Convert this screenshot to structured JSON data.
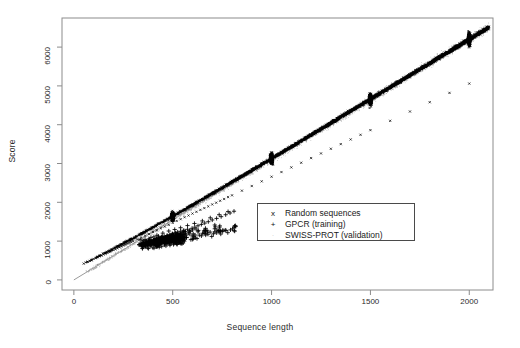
{
  "chart_data": {
    "type": "scatter",
    "title": "",
    "xlabel": "Sequence length",
    "ylabel": "Score",
    "xlim": [
      -60,
      2120
    ],
    "ylim": [
      -260,
      6750
    ],
    "xticks": [
      0,
      500,
      1000,
      1500,
      2000
    ],
    "yticks": [
      0,
      1000,
      2000,
      3000,
      4000,
      5000,
      6000
    ],
    "grid": false,
    "legend_position": "center-right",
    "frame": true,
    "trend_line": {
      "name": "linear fit",
      "slope": 3.1,
      "intercept": 0,
      "x_start": 0,
      "x_end": 2100,
      "color": "#808080"
    },
    "series": [
      {
        "name": "Random sequences",
        "marker": "x",
        "color": "#000000",
        "description": "dense band following score = 3.1 x length, sampled densely at lengths 50-2000 with heavy vertical clusters at 500, 1000, 1500 and 2000",
        "cluster_lengths": [
          500,
          1000,
          1500,
          2000
        ],
        "points": [
          [
            50,
            420
          ],
          [
            60,
            450
          ],
          [
            70,
            470
          ],
          [
            80,
            490
          ],
          [
            90,
            510
          ],
          [
            100,
            540
          ],
          [
            110,
            560
          ],
          [
            120,
            585
          ],
          [
            130,
            610
          ],
          [
            140,
            630
          ],
          [
            150,
            655
          ],
          [
            160,
            675
          ],
          [
            170,
            700
          ],
          [
            180,
            720
          ],
          [
            190,
            745
          ],
          [
            200,
            770
          ],
          [
            210,
            790
          ],
          [
            220,
            815
          ],
          [
            230,
            840
          ],
          [
            240,
            860
          ],
          [
            250,
            885
          ],
          [
            260,
            905
          ],
          [
            270,
            930
          ],
          [
            280,
            955
          ],
          [
            290,
            975
          ],
          [
            300,
            1000
          ],
          [
            320,
            1045
          ],
          [
            340,
            1090
          ],
          [
            360,
            1140
          ],
          [
            380,
            1185
          ],
          [
            400,
            1235
          ],
          [
            420,
            1280
          ],
          [
            440,
            1330
          ],
          [
            460,
            1375
          ],
          [
            480,
            1420
          ],
          [
            500,
            1470
          ],
          [
            520,
            1520
          ],
          [
            540,
            1565
          ],
          [
            560,
            1615
          ],
          [
            580,
            1660
          ],
          [
            600,
            1710
          ],
          [
            620,
            1755
          ],
          [
            640,
            1805
          ],
          [
            660,
            1850
          ],
          [
            680,
            1895
          ],
          [
            700,
            1945
          ],
          [
            720,
            1990
          ],
          [
            740,
            2040
          ],
          [
            760,
            2085
          ],
          [
            780,
            2135
          ],
          [
            800,
            2180
          ],
          [
            850,
            2300
          ],
          [
            900,
            2420
          ],
          [
            950,
            2540
          ],
          [
            1000,
            2660
          ],
          [
            1050,
            2780
          ],
          [
            1100,
            2900
          ],
          [
            1150,
            3020
          ],
          [
            1200,
            3140
          ],
          [
            1250,
            3260
          ],
          [
            1300,
            3380
          ],
          [
            1350,
            3500
          ],
          [
            1400,
            3620
          ],
          [
            1450,
            3740
          ],
          [
            1500,
            3860
          ],
          [
            1600,
            4100
          ],
          [
            1700,
            4340
          ],
          [
            1800,
            4580
          ],
          [
            1900,
            4820
          ],
          [
            2000,
            5060
          ]
        ]
      },
      {
        "name": "GPCR (training)",
        "marker": "+",
        "color": "#000000",
        "description": "cluster of training sequences below the random-sequence band, lengths 320-810, scores 850-1950",
        "points": [
          [
            330,
            905
          ],
          [
            338,
            930
          ],
          [
            345,
            880
          ],
          [
            352,
            950
          ],
          [
            358,
            910
          ],
          [
            365,
            965
          ],
          [
            372,
            935
          ],
          [
            378,
            990
          ],
          [
            385,
            955
          ],
          [
            392,
            1010
          ],
          [
            398,
            975
          ],
          [
            405,
            1030
          ],
          [
            412,
            1000
          ],
          [
            418,
            1055
          ],
          [
            425,
            1020
          ],
          [
            432,
            1080
          ],
          [
            438,
            1045
          ],
          [
            445,
            1100
          ],
          [
            452,
            1065
          ],
          [
            458,
            1120
          ],
          [
            465,
            1090
          ],
          [
            472,
            1145
          ],
          [
            478,
            1110
          ],
          [
            485,
            1165
          ],
          [
            492,
            1135
          ],
          [
            498,
            1190
          ],
          [
            505,
            1155
          ],
          [
            512,
            1210
          ],
          [
            518,
            1180
          ],
          [
            525,
            1235
          ],
          [
            532,
            1200
          ],
          [
            540,
            1255
          ],
          [
            548,
            1225
          ],
          [
            556,
            1280
          ],
          [
            565,
            1250
          ],
          [
            575,
            1305
          ],
          [
            585,
            1275
          ],
          [
            598,
            1330
          ],
          [
            612,
            1360
          ],
          [
            628,
            1395
          ],
          [
            645,
            1430
          ],
          [
            662,
            1465
          ],
          [
            680,
            1500
          ],
          [
            700,
            1545
          ],
          [
            722,
            1585
          ],
          [
            745,
            1630
          ],
          [
            768,
            1680
          ],
          [
            790,
            1725
          ],
          [
            810,
            1770
          ],
          [
            360,
            1040
          ],
          [
            390,
            1095
          ],
          [
            420,
            1150
          ],
          [
            450,
            1205
          ],
          [
            480,
            1260
          ],
          [
            510,
            1300
          ],
          [
            540,
            1345
          ],
          [
            575,
            1400
          ],
          [
            610,
            1455
          ],
          [
            650,
            1520
          ],
          [
            690,
            1600
          ],
          [
            735,
            1680
          ],
          [
            780,
            1760
          ]
        ]
      },
      {
        "name": "SWISS-PROT (validation)",
        "marker": ".",
        "color": "#a0a0a0",
        "description": "faint light-grey point cloud scattered tightly along the regression line across the full length range",
        "points": [
          [
            120,
            400
          ],
          [
            180,
            570
          ],
          [
            240,
            740
          ],
          [
            300,
            930
          ],
          [
            360,
            1120
          ],
          [
            420,
            1300
          ],
          [
            480,
            1490
          ],
          [
            540,
            1680
          ],
          [
            600,
            1860
          ],
          [
            660,
            2050
          ],
          [
            720,
            2240
          ],
          [
            780,
            2420
          ],
          [
            840,
            2610
          ],
          [
            900,
            2790
          ],
          [
            960,
            2980
          ],
          [
            1020,
            3170
          ],
          [
            1080,
            3350
          ],
          [
            1140,
            3540
          ],
          [
            1200,
            3720
          ],
          [
            1260,
            3910
          ],
          [
            1320,
            4100
          ],
          [
            1380,
            4280
          ],
          [
            1440,
            4470
          ],
          [
            1500,
            4650
          ],
          [
            1560,
            4840
          ],
          [
            1620,
            5030
          ],
          [
            1680,
            5210
          ],
          [
            1740,
            5400
          ],
          [
            1800,
            5580
          ],
          [
            1860,
            5770
          ],
          [
            1920,
            5960
          ],
          [
            1980,
            6140
          ],
          [
            2040,
            6330
          ],
          [
            210,
            690
          ],
          [
            390,
            1230
          ],
          [
            570,
            1790
          ],
          [
            750,
            2350
          ],
          [
            930,
            2900
          ],
          [
            1110,
            3460
          ],
          [
            1290,
            4020
          ],
          [
            1470,
            4570
          ],
          [
            1650,
            5130
          ],
          [
            1830,
            5690
          ]
        ]
      }
    ]
  },
  "axes": {
    "x": {
      "title": "Sequence length",
      "tick_labels": [
        "0",
        "500",
        "1000",
        "1500",
        "2000"
      ]
    },
    "y": {
      "title": "Score",
      "tick_labels": [
        "0",
        "1000",
        "2000",
        "3000",
        "4000",
        "5000",
        "6000"
      ]
    }
  },
  "legend": {
    "entries": [
      {
        "marker": "x",
        "label": "Random sequences"
      },
      {
        "marker": "+",
        "label": "GPCR (training)"
      },
      {
        "marker": "·",
        "label": "SWISS-PROT (validation)"
      }
    ]
  },
  "colors": {
    "frame": "#8c8c8c",
    "data_primary": "#000000",
    "data_validation": "#a0a0a0",
    "trend_line": "#808080",
    "text": "#1a1a1a",
    "background": "#ffffff"
  }
}
